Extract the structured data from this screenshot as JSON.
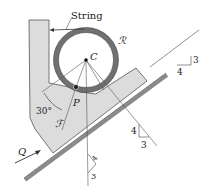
{
  "diagram": {
    "labels": {
      "string": "String",
      "ring": "ℛ",
      "center": "C",
      "pin": "P",
      "angle": "30°",
      "frame": "ℱ",
      "force": "Q"
    },
    "slopes": {
      "incline": {
        "rise": "3",
        "run": "4"
      },
      "line_cp": {
        "rise": "4",
        "run": "3"
      },
      "vertical": {
        "rise": "4",
        "run": "3"
      }
    },
    "colors": {
      "frame_fill": "#d9d9d9",
      "ring": "#6e6e6e",
      "incline": "#7a7a7a",
      "line": "#444444"
    }
  }
}
